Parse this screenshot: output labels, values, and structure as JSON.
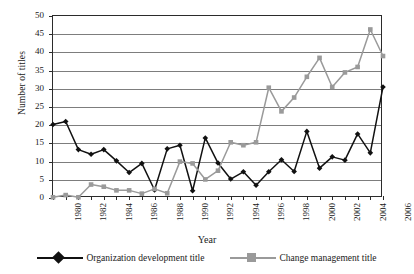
{
  "chart_data": {
    "type": "line",
    "title": "",
    "xlabel": "Year",
    "ylabel": "Number of titles",
    "xlim": [
      1980,
      2006
    ],
    "ylim": [
      0,
      50
    ],
    "ytick_step": 5,
    "yticks": [
      "0",
      "5",
      "10",
      "15",
      "20",
      "25",
      "30",
      "35",
      "40",
      "45",
      "50"
    ],
    "xticks_labeled": [
      "1980",
      "1982",
      "1984",
      "1986",
      "1988",
      "1990",
      "1992",
      "1994",
      "1996",
      "1998",
      "2000",
      "2002",
      "2004",
      "2006"
    ],
    "grid": "horizontal",
    "legend_position": "bottom",
    "x": [
      1980,
      1981,
      1982,
      1983,
      1984,
      1985,
      1986,
      1987,
      1988,
      1989,
      1990,
      1991,
      1992,
      1993,
      1994,
      1995,
      1996,
      1997,
      1998,
      1999,
      2000,
      2001,
      2002,
      2003,
      2004,
      2005,
      2006
    ],
    "series": [
      {
        "name": "Organization development title",
        "color": "#111111",
        "marker": "diamond",
        "values": [
          20.2,
          21.0,
          13.3,
          12.0,
          13.3,
          10.2,
          7.0,
          9.5,
          2.2,
          13.5,
          14.5,
          2.0,
          16.5,
          9.6,
          5.2,
          7.2,
          3.5,
          7.2,
          10.5,
          7.3,
          18.3,
          8.2,
          11.3,
          10.4,
          17.6,
          12.4,
          30.5
        ]
      },
      {
        "name": "Change management title",
        "color": "#9a9a9a",
        "marker": "square",
        "values": [
          0.2,
          0.8,
          0.2,
          3.7,
          3.1,
          2.1,
          2.1,
          1.2,
          2.5,
          1.3,
          10.0,
          9.5,
          5.1,
          7.5,
          15.3,
          14.5,
          15.3,
          30.3,
          23.8,
          27.6,
          33.3,
          38.5,
          30.5,
          34.5,
          36.0,
          46.3,
          39.0
        ]
      }
    ]
  }
}
